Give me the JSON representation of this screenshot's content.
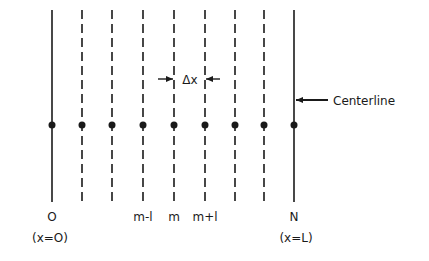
{
  "diagram": {
    "colors": {
      "ink": "#1a1a1a",
      "background": "#ffffff"
    },
    "node_row_y": 125,
    "line_top": 10,
    "line_bottom": 202,
    "nodes": [
      {
        "x": 52,
        "style": "solid",
        "label": "O",
        "sublabel": "(x=O)"
      },
      {
        "x": 82,
        "style": "dashed",
        "label": "",
        "sublabel": ""
      },
      {
        "x": 112,
        "style": "dashed",
        "label": "",
        "sublabel": ""
      },
      {
        "x": 143,
        "style": "dashed",
        "label": "m-l",
        "sublabel": ""
      },
      {
        "x": 174,
        "style": "dashed",
        "label": "m",
        "sublabel": ""
      },
      {
        "x": 205,
        "style": "dashed",
        "label": "m+l",
        "sublabel": ""
      },
      {
        "x": 235,
        "style": "dashed",
        "label": "",
        "sublabel": ""
      },
      {
        "x": 264,
        "style": "dashed",
        "label": "",
        "sublabel": ""
      },
      {
        "x": 294,
        "style": "solid",
        "label": "N",
        "sublabel": "(x=L)"
      }
    ],
    "spacing_label": "Δx",
    "centerline_label": "Centerline",
    "labels": {
      "left_node": "O",
      "left_position": "(x=O)",
      "m_minus_1": "m-l",
      "m": "m",
      "m_plus_1": "m+l",
      "right_node": "N",
      "right_position": "(x=L)"
    }
  }
}
